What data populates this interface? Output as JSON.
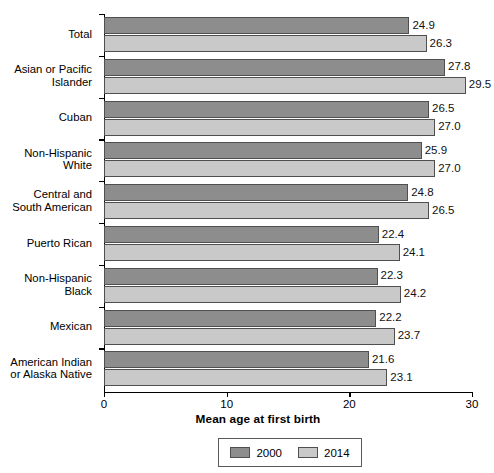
{
  "chart_data": {
    "type": "bar",
    "orientation": "horizontal",
    "title": "",
    "xlabel": "Mean age at first birth",
    "ylabel": "",
    "xlim": [
      0,
      30
    ],
    "xticks": [
      "0",
      "10",
      "20",
      "30"
    ],
    "grid": false,
    "legend_position": "bottom",
    "categories": [
      "Total",
      "Asian or Pacific\nIslander",
      "Cuban",
      "Non-Hispanic\nWhite",
      "Central and\nSouth American",
      "Puerto Rican",
      "Non-Hispanic\nBlack",
      "Mexican",
      "American Indian\nor Alaska Native"
    ],
    "series": [
      {
        "name": "2000",
        "color": "#8d8d8d",
        "values": [
          24.9,
          27.8,
          26.5,
          25.9,
          24.8,
          22.4,
          22.3,
          22.2,
          21.6
        ],
        "labels": [
          "24.9",
          "27.8",
          "26.5",
          "25.9",
          "24.8",
          "22.4",
          "22.3",
          "22.2",
          "21.6"
        ]
      },
      {
        "name": "2014",
        "color": "#c9c9c9",
        "values": [
          26.3,
          29.5,
          27.0,
          27.0,
          26.5,
          24.1,
          24.2,
          23.7,
          23.1
        ],
        "labels": [
          "26.3",
          "29.5",
          "27.0",
          "27.0",
          "26.5",
          "24.1",
          "24.2",
          "23.7",
          "23.1"
        ]
      }
    ]
  },
  "legend": {
    "entries": [
      {
        "label": "2000",
        "color": "#8d8d8d"
      },
      {
        "label": "2014",
        "color": "#c9c9c9"
      }
    ]
  }
}
